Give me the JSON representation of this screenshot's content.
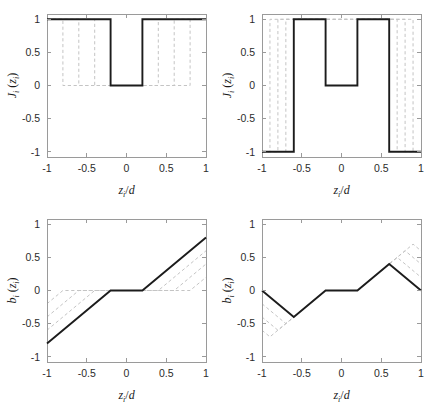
{
  "figure": {
    "width": 430,
    "height": 409,
    "background": "#ffffff",
    "main_curve_color": "#1c1c1c",
    "ghost_curve_color": "#c4c4c4",
    "axis_color": "#9a9a9a"
  },
  "axis_titles": {
    "x_symbol": "z",
    "x_sub": "i",
    "x_denom": "d",
    "x_full": "z_i/d",
    "y_top_symbol": "J",
    "y_top_sub": "i",
    "y_top_arg": "z",
    "y_top_arg_sub": "i",
    "y_top_full": "J_i (z_i)",
    "y_bottom_symbol": "b",
    "y_bottom_sub": "i",
    "y_bottom_arg": "z",
    "y_bottom_arg_sub": "i",
    "y_bottom_full": "b_i (z_i)"
  },
  "ticks": {
    "x": [
      "-1",
      "-0.5",
      "0",
      "0.5",
      "1"
    ],
    "x_values": [
      -1,
      -0.5,
      0,
      0.5,
      1
    ],
    "y": [
      "-1",
      "-0.5",
      "0",
      "0.5",
      "1"
    ],
    "y_values": [
      -1,
      -0.5,
      0,
      0.5,
      1
    ]
  },
  "chart_data": [
    {
      "id": "panel-top-left",
      "type": "line",
      "position": "top-left",
      "title": "",
      "xlabel": "z_i/d",
      "ylabel": "J_i (z_i)",
      "xlim": [
        -1,
        1
      ],
      "ylim": [
        -1.08,
        1.08
      ],
      "grid": false,
      "legend": "none",
      "xticks": [
        -1,
        -0.5,
        0,
        0.5,
        1
      ],
      "yticks": [
        -1,
        -0.5,
        0,
        0.5,
        1
      ],
      "series": [
        {
          "name": "J_i main (step, single notch)",
          "style": "solid",
          "color": "#1c1c1c",
          "x": [
            -1,
            -0.2,
            -0.2,
            0.2,
            0.2,
            1
          ],
          "y": [
            1,
            1,
            0,
            0,
            1,
            1
          ]
        },
        {
          "name": "ghost notch width 0.8",
          "style": "dashed",
          "color": "#c4c4c4",
          "x": [
            -1,
            -0.8,
            -0.8,
            0.8,
            0.8,
            1
          ],
          "y": [
            1,
            1,
            0,
            0,
            1,
            1
          ]
        },
        {
          "name": "ghost notch width 0.6",
          "style": "dashed",
          "color": "#c4c4c4",
          "x": [
            -1,
            -0.6,
            -0.6,
            0.6,
            0.6,
            1
          ],
          "y": [
            1,
            1,
            0,
            0,
            1,
            1
          ]
        },
        {
          "name": "ghost notch width 0.4",
          "style": "dashed",
          "color": "#c4c4c4",
          "x": [
            -1,
            -0.4,
            -0.4,
            0.4,
            0.4,
            1
          ],
          "y": [
            1,
            1,
            0,
            0,
            1,
            1
          ]
        }
      ]
    },
    {
      "id": "panel-top-right",
      "type": "line",
      "position": "top-right",
      "title": "",
      "xlabel": "z_i/d",
      "ylabel": "J_i (z_i)",
      "xlim": [
        -1,
        1
      ],
      "ylim": [
        -1.08,
        1.08
      ],
      "grid": false,
      "legend": "none",
      "xticks": [
        -1,
        -0.5,
        0,
        0.5,
        1
      ],
      "yticks": [
        -1,
        -0.5,
        0,
        0.5,
        1
      ],
      "series": [
        {
          "name": "J_i main (three-level staircase)",
          "style": "solid",
          "color": "#1c1c1c",
          "x": [
            -1,
            -0.6,
            -0.6,
            -0.2,
            -0.2,
            0.2,
            0.2,
            0.6,
            0.6,
            1
          ],
          "y": [
            -1,
            -1,
            1,
            1,
            0,
            0,
            1,
            1,
            -1,
            -1
          ]
        },
        {
          "name": "ghost outer transition at 0.9",
          "style": "dashed",
          "color": "#c4c4c4",
          "x": [
            -1,
            -0.9,
            -0.9,
            0.9,
            0.9,
            1
          ],
          "y": [
            -1,
            -1,
            1,
            1,
            -1,
            -1
          ]
        },
        {
          "name": "ghost outer transition at 0.8",
          "style": "dashed",
          "color": "#c4c4c4",
          "x": [
            -1,
            -0.8,
            -0.8,
            0.8,
            0.8,
            1
          ],
          "y": [
            -1,
            -1,
            1,
            1,
            -1,
            -1
          ]
        },
        {
          "name": "ghost outer transition at 0.7",
          "style": "dashed",
          "color": "#c4c4c4",
          "x": [
            -1,
            -0.7,
            -0.7,
            0.7,
            0.7,
            1
          ],
          "y": [
            -1,
            -1,
            1,
            1,
            -1,
            -1
          ]
        }
      ]
    },
    {
      "id": "panel-bottom-left",
      "type": "line",
      "position": "bottom-left",
      "title": "",
      "xlabel": "z_i/d",
      "ylabel": "b_i (z_i)",
      "xlim": [
        -1,
        1
      ],
      "ylim": [
        -1.08,
        1.08
      ],
      "grid": false,
      "legend": "none",
      "xticks": [
        -1,
        -0.5,
        0,
        0.5,
        1
      ],
      "yticks": [
        -1,
        -0.5,
        0,
        0.5,
        1
      ],
      "series": [
        {
          "name": "b_i main (dead-zone ramp)",
          "style": "solid",
          "color": "#1c1c1c",
          "x": [
            -1,
            -0.2,
            0.2,
            1
          ],
          "y": [
            -0.8,
            0,
            0,
            0.8
          ]
        },
        {
          "name": "ghost dead-zone 0.4",
          "style": "dashed",
          "color": "#c4c4c4",
          "x": [
            -1,
            -0.4,
            0.4,
            1
          ],
          "y": [
            -0.6,
            0,
            0,
            0.6
          ]
        },
        {
          "name": "ghost dead-zone 0.6",
          "style": "dashed",
          "color": "#c4c4c4",
          "x": [
            -1,
            -0.6,
            0.6,
            1
          ],
          "y": [
            -0.4,
            0,
            0,
            0.4
          ]
        },
        {
          "name": "ghost dead-zone 0.8",
          "style": "dashed",
          "color": "#c4c4c4",
          "x": [
            -1,
            -0.8,
            0.8,
            1
          ],
          "y": [
            -0.2,
            0,
            0,
            0.2
          ]
        }
      ]
    },
    {
      "id": "panel-bottom-right",
      "type": "line",
      "position": "bottom-right",
      "title": "",
      "xlabel": "z_i/d",
      "ylabel": "b_i (z_i)",
      "xlim": [
        -1,
        1
      ],
      "ylim": [
        -1.08,
        1.08
      ],
      "grid": false,
      "legend": "none",
      "xticks": [
        -1,
        -0.5,
        0,
        0.5,
        1
      ],
      "yticks": [
        -1,
        -0.5,
        0,
        0.5,
        1
      ],
      "series": [
        {
          "name": "b_i main (triangular sawtooth)",
          "style": "solid",
          "color": "#1c1c1c",
          "x": [
            -1,
            -0.6,
            -0.2,
            0.2,
            0.6,
            1
          ],
          "y": [
            0,
            -0.4,
            0,
            0,
            0.4,
            0
          ]
        },
        {
          "name": "ghost peak 0.5 at 0.7",
          "style": "dashed",
          "color": "#c4c4c4",
          "x": [
            -1,
            -0.7,
            -0.2,
            0.2,
            0.7,
            1
          ],
          "y": [
            -0.2,
            -0.5,
            0,
            0,
            0.5,
            0.2
          ]
        },
        {
          "name": "ghost peak 0.6 at 0.8",
          "style": "dashed",
          "color": "#c4c4c4",
          "x": [
            -1,
            -0.8,
            -0.2,
            0.2,
            0.8,
            1
          ],
          "y": [
            -0.4,
            -0.6,
            0,
            0,
            0.6,
            0.4
          ]
        },
        {
          "name": "ghost peak 0.7 at 0.9",
          "style": "dashed",
          "color": "#c4c4c4",
          "x": [
            -1,
            -0.9,
            -0.2,
            0.2,
            0.9,
            1
          ],
          "y": [
            -0.6,
            -0.7,
            0,
            0,
            0.7,
            0.6
          ]
        }
      ]
    }
  ]
}
